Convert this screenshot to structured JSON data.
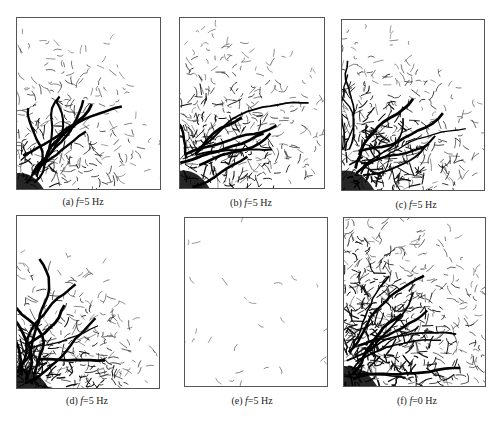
{
  "figure": {
    "panels": [
      {
        "id": "a",
        "label": "(a)",
        "var": "f",
        "eq": "=5 Hz",
        "pattern": "sparse-upper-left-dense-corner",
        "density": 0.55,
        "front": 0.45
      },
      {
        "id": "b",
        "label": "(b)",
        "var": "f",
        "eq": "=5 Hz",
        "pattern": "bottom-left-dense",
        "density": 0.7,
        "front": 0.42
      },
      {
        "id": "c",
        "label": "(c)",
        "var": "f",
        "eq": "=5 Hz",
        "pattern": "bottom-left-very-dense",
        "density": 0.9,
        "front": 0.48
      },
      {
        "id": "d",
        "label": "(d)",
        "var": "f",
        "eq": "=5 Hz",
        "pattern": "bottom-left-corner-dense",
        "density": 0.85,
        "front": 0.6
      },
      {
        "id": "e",
        "label": "(e)",
        "var": "f",
        "eq": "=5 Hz",
        "pattern": "scattered-sparse",
        "density": 0.2,
        "front": 0.4
      },
      {
        "id": "f",
        "label": "(f)",
        "var": "f",
        "eq": "=0 Hz",
        "pattern": "left-dense-fan",
        "density": 0.95,
        "front": 0.3
      }
    ]
  }
}
